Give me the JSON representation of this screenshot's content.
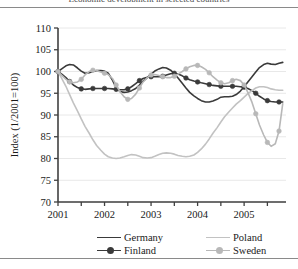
{
  "page": {
    "clipped_header_text": "Economic development in selected countries"
  },
  "chart_data": {
    "type": "line",
    "title": "",
    "subtitle": "",
    "xlabel": "",
    "ylabel": "Index (1/2001=100)",
    "xlim": [
      2001.0,
      2005.9
    ],
    "ylim": [
      70,
      110
    ],
    "yticks": [
      70,
      75,
      80,
      85,
      90,
      95,
      100,
      105,
      110
    ],
    "ytick_labels": [
      "70",
      "75",
      "80",
      "85",
      "90",
      "95",
      "100",
      "105",
      "110"
    ],
    "xticks": [
      2001.0,
      2001.5,
      2002.0,
      2002.5,
      2003.0,
      2003.5,
      2004.0,
      2004.5,
      2005.0,
      2005.5
    ],
    "xtick_labels": [
      "2001",
      "",
      "2002",
      "",
      "2003",
      "",
      "2004",
      "",
      "2005",
      ""
    ],
    "grid": "horizontal",
    "legend_position": "bottom",
    "colors": {
      "germany": "#3a3a3a",
      "finland": "#3a3a3a",
      "poland": "#c2c2c2",
      "sweden": "#b8b8b8",
      "axis": "#404040",
      "gridline": "#e8e8e8"
    },
    "x": [
      2001.0,
      2001.08,
      2001.17,
      2001.25,
      2001.33,
      2001.42,
      2001.5,
      2001.58,
      2001.67,
      2001.75,
      2001.83,
      2001.92,
      2002.0,
      2002.08,
      2002.17,
      2002.25,
      2002.33,
      2002.42,
      2002.5,
      2002.58,
      2002.67,
      2002.75,
      2002.83,
      2002.92,
      2003.0,
      2003.08,
      2003.17,
      2003.25,
      2003.33,
      2003.42,
      2003.5,
      2003.58,
      2003.67,
      2003.75,
      2003.83,
      2003.92,
      2004.0,
      2004.08,
      2004.17,
      2004.25,
      2004.33,
      2004.42,
      2004.5,
      2004.58,
      2004.67,
      2004.75,
      2004.83,
      2004.92,
      2005.0,
      2005.08,
      2005.17,
      2005.25,
      2005.33,
      2005.42,
      2005.5,
      2005.58,
      2005.67,
      2005.75,
      2005.83
    ],
    "series": [
      {
        "name": "Germany",
        "color": "#3a3a3a",
        "markers": false,
        "width": 1.6,
        "values": [
          100.0,
          100.6,
          101.3,
          101.6,
          101.5,
          100.8,
          100.1,
          99.6,
          99.7,
          100.0,
          100.2,
          100.2,
          100.1,
          99.6,
          98.0,
          96.3,
          95.4,
          95.2,
          95.3,
          95.6,
          96.1,
          96.9,
          97.8,
          98.6,
          99.4,
          100.1,
          100.6,
          100.9,
          100.8,
          100.3,
          99.5,
          98.5,
          97.3,
          96.2,
          95.2,
          94.4,
          93.8,
          93.3,
          93.0,
          93.0,
          93.2,
          93.6,
          94.1,
          94.2,
          94.2,
          94.3,
          94.7,
          95.5,
          96.5,
          97.6,
          98.8,
          99.9,
          100.9,
          101.6,
          101.9,
          101.7,
          101.6,
          101.9,
          102.1
        ]
      },
      {
        "name": "Finland",
        "color": "#3a3a3a",
        "markers": true,
        "width": 1.6,
        "values": [
          100.0,
          99.4,
          98.6,
          97.7,
          96.9,
          96.3,
          96.0,
          95.9,
          96.0,
          96.1,
          96.1,
          96.1,
          96.1,
          96.1,
          96.0,
          95.9,
          95.8,
          95.8,
          96.0,
          96.5,
          97.2,
          97.9,
          98.4,
          98.7,
          98.8,
          98.8,
          98.8,
          98.9,
          99.2,
          99.5,
          99.6,
          99.4,
          99.0,
          98.5,
          98.1,
          97.8,
          97.6,
          97.4,
          97.2,
          97.0,
          96.8,
          96.7,
          96.6,
          96.6,
          96.6,
          96.6,
          96.6,
          96.5,
          96.4,
          96.1,
          95.6,
          95.0,
          94.3,
          93.7,
          93.3,
          93.1,
          93.0,
          93.0,
          93.0
        ]
      },
      {
        "name": "Poland",
        "color": "#c2c2c2",
        "markers": false,
        "width": 1.6,
        "values": [
          100.0,
          98.4,
          96.6,
          94.7,
          92.8,
          90.9,
          89.1,
          87.4,
          85.8,
          84.3,
          83.0,
          81.9,
          81.0,
          80.4,
          80.1,
          80.0,
          80.1,
          80.4,
          80.7,
          80.9,
          80.8,
          80.5,
          80.2,
          80.1,
          80.2,
          80.5,
          80.9,
          81.2,
          81.3,
          81.2,
          81.0,
          80.7,
          80.5,
          80.4,
          80.5,
          80.8,
          81.4,
          82.2,
          83.3,
          84.5,
          85.8,
          87.1,
          88.4,
          89.6,
          90.7,
          91.6,
          92.5,
          93.3,
          94.1,
          94.9,
          95.6,
          96.2,
          96.5,
          96.5,
          96.3,
          96.0,
          95.8,
          95.7,
          95.7
        ]
      },
      {
        "name": "Sweden",
        "color": "#b8b8b8",
        "markers": true,
        "width": 1.6,
        "values": [
          100.0,
          99.1,
          98.2,
          97.6,
          97.4,
          97.6,
          98.2,
          99.2,
          100.0,
          100.3,
          100.2,
          99.9,
          99.6,
          99.3,
          98.4,
          96.9,
          95.4,
          94.2,
          93.6,
          93.8,
          94.8,
          96.2,
          97.6,
          98.6,
          99.2,
          99.3,
          99.1,
          98.8,
          98.6,
          98.6,
          98.9,
          99.4,
          100.0,
          100.6,
          101.1,
          101.4,
          101.4,
          101.1,
          100.5,
          99.7,
          98.8,
          98.0,
          97.4,
          97.2,
          97.4,
          97.9,
          98.2,
          97.9,
          96.9,
          95.2,
          92.9,
          90.3,
          87.7,
          85.4,
          83.7,
          82.8,
          83.4,
          86.3,
          92.6
        ]
      }
    ]
  },
  "legend": {
    "entries": [
      {
        "label": "Germany",
        "color": "#3a3a3a",
        "marker": false
      },
      {
        "label": "Finland",
        "color": "#3a3a3a",
        "marker": true
      },
      {
        "label": "Poland",
        "color": "#c2c2c2",
        "marker": false
      },
      {
        "label": "Sweden",
        "color": "#b8b8b8",
        "marker": true
      }
    ]
  }
}
